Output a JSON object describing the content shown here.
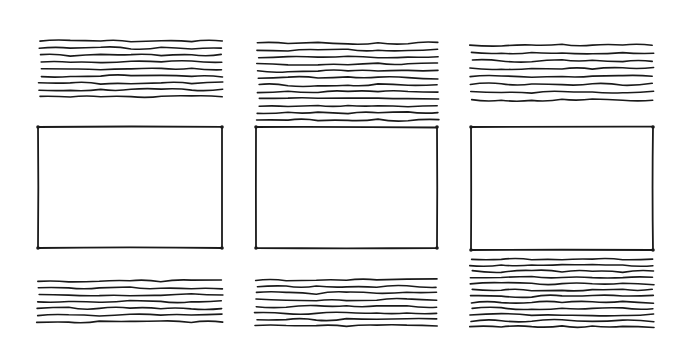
{
  "diagram": {
    "background": "#ffffff",
    "ink_color": "#1a1a1a",
    "panels": [
      {
        "id": "panel-1",
        "top_text": {
          "x1": 40,
          "x2": 222,
          "y_start": 41,
          "y_end": 97,
          "line_count": 9
        },
        "frame": {
          "x": 38,
          "y": 127,
          "w": 184,
          "h": 121
        },
        "bottom_text": {
          "x1": 38,
          "x2": 222,
          "y_start": 281,
          "y_end": 322,
          "line_count": 7
        }
      },
      {
        "id": "panel-2",
        "top_text": {
          "x1": 258,
          "x2": 438,
          "y_start": 43,
          "y_end": 120,
          "line_count": 12
        },
        "frame": {
          "x": 256,
          "y": 127,
          "w": 181,
          "h": 121
        },
        "bottom_text": {
          "x1": 256,
          "x2": 437,
          "y_start": 280,
          "y_end": 326,
          "line_count": 8
        }
      },
      {
        "id": "panel-3",
        "top_text": {
          "x1": 471,
          "x2": 653,
          "y_start": 45,
          "y_end": 100,
          "line_count": 8
        },
        "frame": {
          "x": 471,
          "y": 127,
          "w": 182,
          "h": 123
        },
        "bottom_text": {
          "x1": 471,
          "x2": 653,
          "y_start": 259,
          "y_end": 327,
          "line_count": 12
        }
      }
    ]
  }
}
